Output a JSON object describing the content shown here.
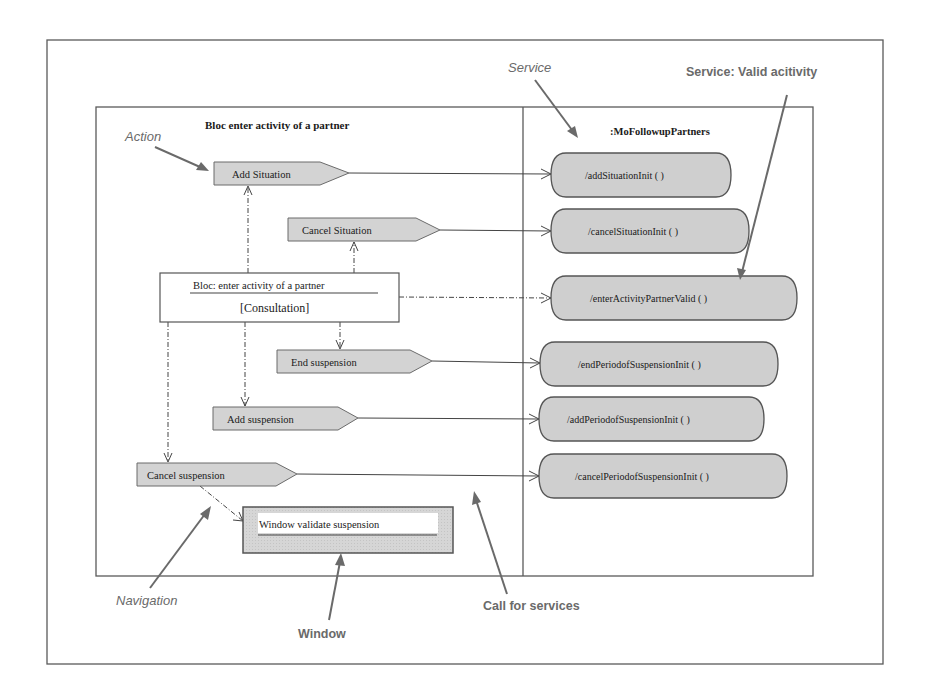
{
  "annotations": {
    "action": "Action",
    "service": "Service",
    "service_valid": "Service: Valid acitivity",
    "navigation": "Navigation",
    "window": "Window",
    "call_for_services": "Call for services"
  },
  "left_panel": {
    "title": "Bloc enter activity of a partner",
    "bloc": {
      "title": "Bloc: enter activity of a partner",
      "subtitle": "[Consultation]"
    },
    "actions": [
      {
        "label": "Add Situation"
      },
      {
        "label": "Cancel Situation"
      },
      {
        "label": "End suspension"
      },
      {
        "label": "Add suspension"
      },
      {
        "label": "Cancel suspension"
      }
    ],
    "window": {
      "label": "Window validate suspension"
    }
  },
  "right_panel": {
    "title": ":MoFollowupPartners",
    "services": [
      {
        "label": "/addSituationInit ( )"
      },
      {
        "label": "/cancelSituationInit ( )"
      },
      {
        "label": "/enterActivityPartnerValid ( )"
      },
      {
        "label": "/endPeriodofSuspensionInit ( )"
      },
      {
        "label": "/addPeriodofSuspensionInit ( )"
      },
      {
        "label": "/cancelPeriodofSuspensionInit ( )"
      }
    ]
  },
  "colors": {
    "action_fill": "#d3d3d3",
    "service_fill": "#cfcfcf",
    "annotation_text": "#6a6a6a",
    "line": "#444444"
  }
}
